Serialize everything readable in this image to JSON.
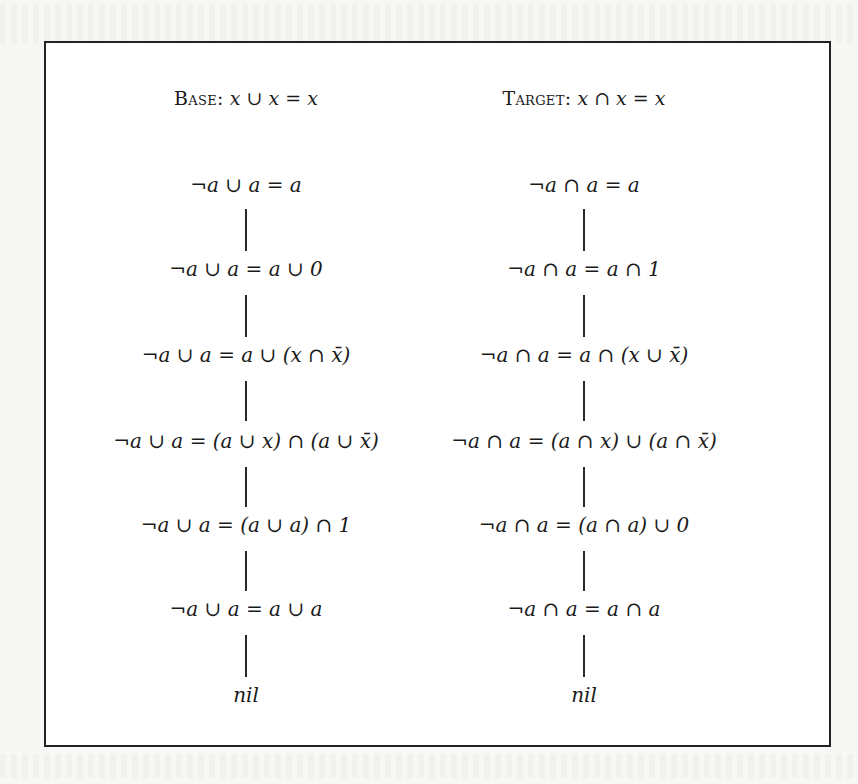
{
  "figure": {
    "base": {
      "label": "Base:",
      "rule": "x ∪ x = x",
      "steps": [
        "¬a ∪ a = a",
        "¬a ∪ a = a ∪ 0",
        "¬a ∪ a = a ∪ (x ∩ x̄)",
        "¬a ∪ a = (a ∪ x) ∩ (a ∪ x̄)",
        "¬a ∪ a = (a ∪ a) ∩ 1",
        "¬a ∪ a = a ∪ a",
        "nil"
      ]
    },
    "target": {
      "label": "Target:",
      "rule": "x ∩ x = x",
      "steps": [
        "¬a ∩ a = a",
        "¬a ∩ a = a ∩ 1",
        "¬a ∩ a = a ∩ (x ∪ x̄)",
        "¬a ∩ a = (a ∩ x) ∪ (a ∩ x̄)",
        "¬a ∩ a = (a ∩ a) ∪ 0",
        "¬a ∩ a = a ∩ a",
        "nil"
      ]
    }
  }
}
